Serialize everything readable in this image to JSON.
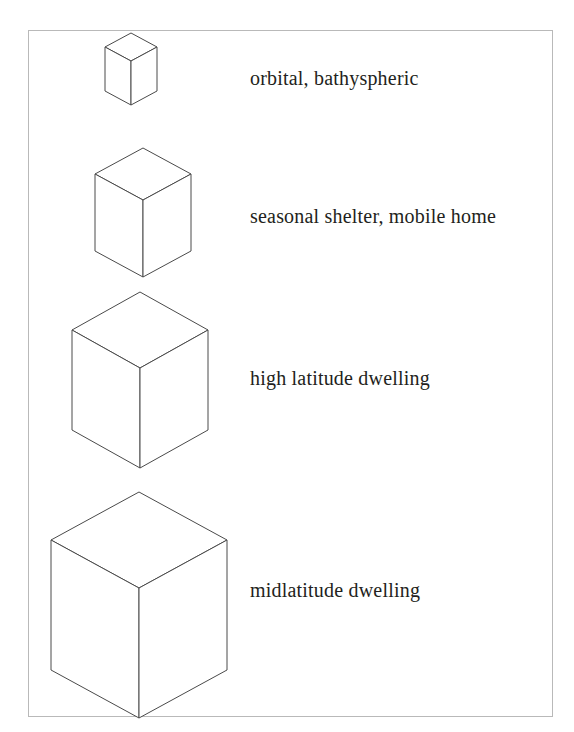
{
  "figure": {
    "type": "diagram",
    "frame": {
      "stroke_color": "#b9b9b9",
      "fill_color": "#ffffff"
    },
    "cube_style": {
      "stroke_color": "#4a4a4a",
      "fill_color": "#ffffff",
      "stroke_width": 1
    },
    "text_color": "#231f20",
    "rows": [
      {
        "index": 0,
        "label": "orbital, bathyspheric",
        "cube": {
          "center_x": 131,
          "top_y": 33,
          "half_width": 26,
          "top_half_height": 14,
          "side_height": 44
        }
      },
      {
        "index": 1,
        "label": "seasonal shelter, mobile home",
        "cube": {
          "center_x": 143,
          "top_y": 148,
          "half_width": 48,
          "top_half_height": 26,
          "side_height": 77
        }
      },
      {
        "index": 2,
        "label": "high latitude dwelling",
        "cube": {
          "center_x": 140,
          "top_y": 292,
          "half_width": 68,
          "top_half_height": 38,
          "side_height": 100
        }
      },
      {
        "index": 3,
        "label": "midlatitude dwelling",
        "cube": {
          "center_x": 139,
          "top_y": 492,
          "half_width": 88,
          "top_half_height": 48,
          "side_height": 130
        }
      }
    ]
  }
}
